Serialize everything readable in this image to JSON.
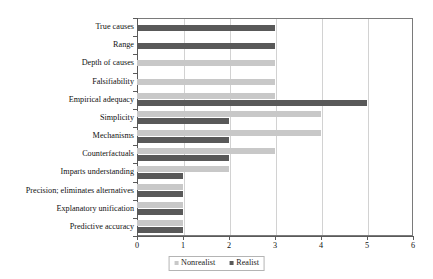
{
  "chart_data": {
    "type": "bar",
    "orientation": "horizontal",
    "title": "",
    "xlabel": "",
    "ylabel": "",
    "xlim": [
      0,
      6
    ],
    "xticks": [
      "0",
      "1",
      "2",
      "3",
      "4",
      "5",
      "6"
    ],
    "grid": true,
    "legend_position": "bottom",
    "categories": [
      "True causes",
      "Range",
      "Depth of causes",
      "Falsifiability",
      "Empirical adequacy",
      "Simplicity",
      "Mechanisms",
      "Counterfactuals",
      "Imparts understanding",
      "Precision; eliminates alternatives",
      "Explanatory unification",
      "Predictive accuracy"
    ],
    "series": [
      {
        "name": "Nonrealist",
        "color": "#c8c8c8",
        "values": [
          0,
          0,
          3,
          3,
          3,
          4,
          4,
          3,
          2,
          1,
          1,
          1
        ]
      },
      {
        "name": "Realist",
        "color": "#595959",
        "values": [
          3,
          3,
          0,
          0,
          5,
          2,
          2,
          2,
          1,
          1,
          1,
          1
        ]
      }
    ]
  },
  "legend": {
    "items": [
      {
        "label": "Nonrealist",
        "swatch": "nonrealist-swatch-icon"
      },
      {
        "label": "Realist",
        "swatch": "realist-swatch-icon"
      }
    ]
  }
}
